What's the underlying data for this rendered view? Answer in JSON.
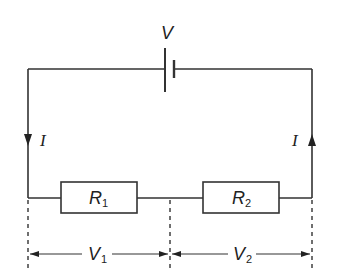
{
  "diagram": {
    "type": "series circuit",
    "battery": {
      "label": "V"
    },
    "current_left": {
      "label": "I",
      "direction": "down"
    },
    "current_right": {
      "label": "I",
      "direction": "up"
    },
    "resistors": [
      {
        "label": "R",
        "subscript": "1"
      },
      {
        "label": "R",
        "subscript": "2"
      }
    ],
    "voltages": [
      {
        "label": "V",
        "subscript": "1"
      },
      {
        "label": "V",
        "subscript": "2"
      }
    ],
    "colors": {
      "line": "#333333",
      "background": "#ffffff"
    }
  }
}
